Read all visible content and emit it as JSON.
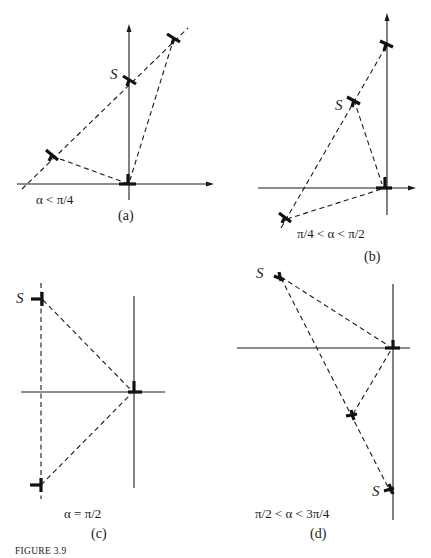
{
  "figure": {
    "caption": "FIGURE 3.9",
    "colors": {
      "ink": "#1a1a1a",
      "background": "#ffffff"
    },
    "panels": [
      {
        "id": "a",
        "panel_label": "(a)",
        "condition": "α < π/4",
        "s_labels": [
          "S"
        ],
        "axes": {
          "horizontal": {
            "x1": 17,
            "y": 184,
            "x2": 214,
            "arrow": true
          },
          "vertical": {
            "x": 129,
            "y1": 200,
            "y2": 25,
            "arrow": true
          }
        },
        "points": [
          {
            "name": "origin",
            "x": 128,
            "y": 184
          },
          {
            "name": "S",
            "x": 130,
            "y": 80
          },
          {
            "name": "upper-right",
            "x": 174,
            "y": 38
          },
          {
            "name": "lower-left",
            "x": 52,
            "y": 156
          }
        ]
      },
      {
        "id": "b",
        "panel_label": "(b)",
        "condition": "π/4 < α < π/2",
        "s_labels": [
          "S"
        ],
        "axes": {
          "horizontal": {
            "x1": 258,
            "y": 188,
            "x2": 415,
            "arrow": true
          },
          "vertical": {
            "x": 387,
            "y1": 215,
            "y2": 14,
            "arrow": true
          }
        },
        "points": [
          {
            "name": "origin",
            "x": 384,
            "y": 188
          },
          {
            "name": "upper",
            "x": 386,
            "y": 45
          },
          {
            "name": "S",
            "x": 354,
            "y": 100
          },
          {
            "name": "lower-left",
            "x": 285,
            "y": 218
          }
        ]
      },
      {
        "id": "c",
        "panel_label": "(c)",
        "condition": "α = π/2",
        "s_labels": [
          "S"
        ],
        "axes": {
          "horizontal": {
            "x1": 21,
            "y": 392,
            "x2": 165,
            "arrow": false
          },
          "vertical": {
            "x": 134,
            "y1": 488,
            "y2": 296,
            "arrow": false
          }
        },
        "points": [
          {
            "name": "origin",
            "x": 133,
            "y": 392
          },
          {
            "name": "S",
            "x": 42,
            "y": 300
          },
          {
            "name": "bottom",
            "x": 40,
            "y": 485
          }
        ]
      },
      {
        "id": "d",
        "panel_label": "(d)",
        "condition": "π/2 < α < 3π/4",
        "s_labels": [
          "S",
          "S"
        ],
        "axes": {
          "horizontal": {
            "x1": 237,
            "y": 348,
            "x2": 410,
            "arrow": false
          },
          "vertical": {
            "x": 393,
            "y1": 520,
            "y2": 284,
            "arrow": false
          }
        },
        "points": [
          {
            "name": "origin",
            "x": 392,
            "y": 348
          },
          {
            "name": "S-top",
            "x": 279,
            "y": 276
          },
          {
            "name": "middle",
            "x": 352,
            "y": 415
          },
          {
            "name": "S-bottom",
            "x": 390,
            "y": 490
          }
        ]
      }
    ]
  }
}
